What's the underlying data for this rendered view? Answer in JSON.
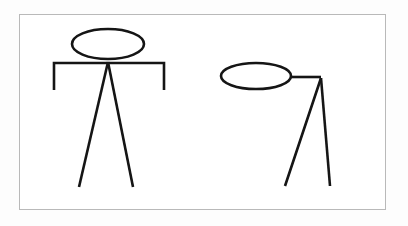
{
  "canvas": {
    "width": 408,
    "height": 226,
    "background_color": "#fdfdfd",
    "inner_background_color": "#ffffff"
  },
  "frame": {
    "name": "diagram-border",
    "x": 19,
    "y": 14,
    "width": 367,
    "height": 196,
    "border_color": "#b9b9b9",
    "border_width": 1
  },
  "style": {
    "stroke_color": "#151515",
    "stroke_width": 2.6
  },
  "chart_data": {
    "type": "diagram",
    "title": "",
    "subtitle": "",
    "figures": [
      {
        "id": "figure-left",
        "label": "front-facing stick figure",
        "head": {
          "shape": "ellipse",
          "center_x": 108,
          "center_y": 44,
          "radius_x": 36,
          "radius_y": 15
        },
        "body": {
          "apex_x": 108,
          "apex_y": 62
        },
        "arms": {
          "type": "horizontal-bar-with-down-ends",
          "bar_y": 63,
          "left_x": 54,
          "right_x": 164,
          "drop_to_y": 90
        },
        "legs": [
          {
            "name": "left-leg",
            "from_x": 108,
            "from_y": 62,
            "to_x": 79,
            "to_y": 187
          },
          {
            "name": "right-leg",
            "from_x": 108,
            "from_y": 62,
            "to_x": 133,
            "to_y": 187
          }
        ]
      },
      {
        "id": "figure-right",
        "label": "profile stick figure",
        "head": {
          "shape": "ellipse",
          "center_x": 256,
          "center_y": 76,
          "radius_x": 35,
          "radius_y": 13
        },
        "body": {
          "apex_x": 321,
          "apex_y": 78
        },
        "arms": {
          "type": "single-horizontal-arm",
          "bar_y": 77,
          "left_x": 291,
          "right_x": 321
        },
        "legs": [
          {
            "name": "left-leg",
            "from_x": 321,
            "from_y": 78,
            "to_x": 285,
            "to_y": 186
          },
          {
            "name": "right-leg",
            "from_x": 321,
            "from_y": 78,
            "to_x": 330,
            "to_y": 186
          }
        ]
      }
    ],
    "xlabel": "",
    "ylabel": "",
    "legend": [],
    "annotations": []
  }
}
